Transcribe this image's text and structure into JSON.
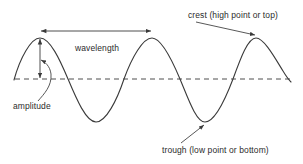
{
  "diagram": {
    "background_color": "#ffffff",
    "stroke_color": "#3a3a3a",
    "text_color": "#2b2b2b",
    "labels": {
      "wavelength": "wavelength",
      "amplitude": "amplitude",
      "crest": "crest (high point or top)",
      "trough": "trough (low point or bottom)"
    },
    "geometry": {
      "baseline_y": 79,
      "baseline_x_start": 15,
      "baseline_x_end": 291,
      "wave_x_start": 14,
      "wave_x_end": 291,
      "crest_y": 38,
      "trough_y": 122,
      "crests_x": [
        40,
        152,
        256
      ],
      "troughs_x": [
        96,
        205
      ],
      "wavelength_arrow": {
        "x1": 40,
        "x2": 152,
        "y": 31
      },
      "amplitude_arrow": {
        "x": 40,
        "y_top": 38,
        "y_bottom": 79
      },
      "crest_leader": {
        "x1": 196,
        "y1": 22,
        "x2": 256,
        "y2": 35
      },
      "trough_leader": {
        "x1": 181,
        "y1": 143,
        "x2": 205,
        "y2": 124
      }
    }
  }
}
